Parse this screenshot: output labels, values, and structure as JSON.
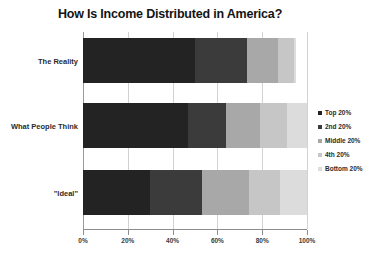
{
  "chart_data": {
    "type": "bar",
    "orientation": "horizontal",
    "stacked": true,
    "normalized_percent": true,
    "title": "How Is Income Distributed in America?",
    "xlabel": "",
    "ylabel": "",
    "xlim": [
      0,
      100
    ],
    "xticks": [
      0,
      20,
      40,
      60,
      80,
      100
    ],
    "xtick_labels": [
      "0%",
      "20%",
      "40%",
      "60%",
      "80%",
      "100%"
    ],
    "grid": true,
    "grid_axis": "x",
    "legend_position": "right",
    "categories": [
      "The Reality",
      "What People Think",
      "\"Ideal\""
    ],
    "series": [
      {
        "name": "Top 20%",
        "color": "#232323",
        "values": [
          50,
          47,
          30
        ]
      },
      {
        "name": "2nd 20%",
        "color": "#3b3b3b",
        "values": [
          23,
          17,
          23
        ]
      },
      {
        "name": "Middle 20%",
        "color": "#a8a8a8",
        "values": [
          14,
          15,
          21
        ]
      },
      {
        "name": "4th 20%",
        "color": "#c6c6c6",
        "values": [
          7,
          12,
          14
        ]
      },
      {
        "name": "Bottom 20%",
        "color": "#dcdcdc",
        "values": [
          1,
          9,
          12
        ]
      }
    ]
  },
  "legend": {
    "items": [
      {
        "label": "Top 20%",
        "color": "#232323"
      },
      {
        "label": "2nd 20%",
        "color": "#3b3b3b"
      },
      {
        "label": "Middle 20%",
        "color": "#a8a8a8"
      },
      {
        "label": "4th 20%",
        "color": "#c6c6c6"
      },
      {
        "label": "Bottom 20%",
        "color": "#dcdcdc"
      }
    ]
  },
  "colors": {
    "background": "#ffffff",
    "title_text": "#141414",
    "axis_line": "#8d8d8d",
    "gridline": "#d2d2d2",
    "label_text": "#2b2b2b"
  }
}
